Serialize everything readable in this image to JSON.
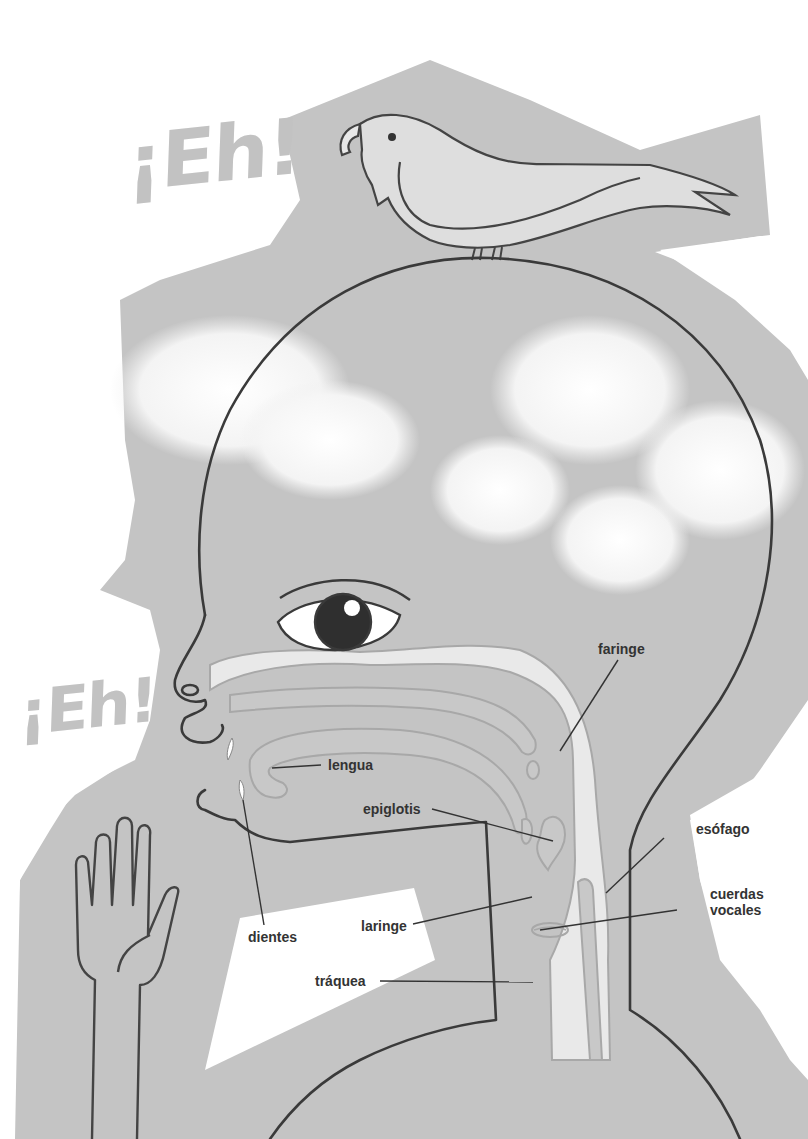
{
  "exclamations": [
    {
      "text": "¡Eh!",
      "position": "top-left"
    },
    {
      "text": "¡Eh!",
      "position": "middle-left"
    }
  ],
  "labels": {
    "faringe": "faringe",
    "lengua": "lengua",
    "epiglotis": "epiglotis",
    "esofago": "esófago",
    "cuerdas_line1": "cuerdas",
    "cuerdas_line2": "vocales",
    "dientes": "dientes",
    "laringe": "laringe",
    "traquea": "tráquea"
  },
  "colors": {
    "background_shape": "#c4c4c4",
    "paper": "#ffffff",
    "outline": "#3a3a3a",
    "airway": "#e6e6e6",
    "exclamation": "#c2c2c2"
  }
}
